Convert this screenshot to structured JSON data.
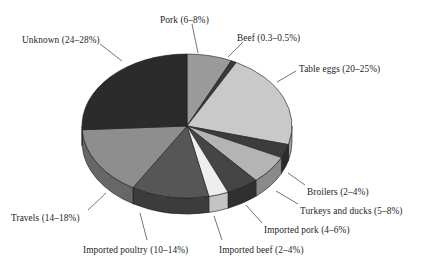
{
  "figure": {
    "kind": "pie-chart-3d",
    "background": "#ffffff"
  },
  "chart_data": {
    "type": "pie",
    "title": "",
    "subtitle": "",
    "xlabel": "",
    "ylabel": "",
    "legend_position": "none",
    "labels_outside": true,
    "grid": false,
    "three_d": true,
    "depth_px": 16,
    "center": [
      187,
      126
    ],
    "radius_x": 105,
    "radius_y": 72,
    "start_angle_deg": 0,
    "direction": "clockwise",
    "categories": [
      "Pork",
      "Beef",
      "Table eggs",
      "Broilers",
      "Turkeys and ducks",
      "Imported pork",
      "Imported beef",
      "Imported poultry",
      "Travels",
      "Unknown"
    ],
    "values": [
      7.0,
      0.4,
      22.0,
      3.0,
      6.5,
      5.0,
      3.0,
      12.0,
      16.0,
      26.0
    ],
    "range_labels": [
      "6–8%",
      "0.3–0.5%",
      "20–25%",
      "2–4%",
      "5–8%",
      "4–6%",
      "2–4%",
      "10–14%",
      "14–18%",
      "24–28%"
    ],
    "slices": [
      {
        "name": "Pork",
        "label": "Pork (6–8%)",
        "range": "6–8%",
        "value": 7.0,
        "a0": 0,
        "a1": 25,
        "top": "#9a9a9a",
        "side": "#6f6f6f"
      },
      {
        "name": "Beef",
        "label": "Beef (0.3–0.5%)",
        "range": "0.3–0.5%",
        "value": 0.4,
        "a0": 25,
        "a1": 28,
        "top": "#3a3a3a",
        "side": "#2a2a2a"
      },
      {
        "name": "Table eggs",
        "label": "Table eggs (20–25%)",
        "range": "20–25%",
        "value": 22.0,
        "a0": 28,
        "a1": 105,
        "top": "#c9c9c9",
        "side": "#9c9c9c"
      },
      {
        "name": "Broilers",
        "label": "Broilers (2–4%)",
        "range": "2–4%",
        "value": 3.0,
        "a0": 105,
        "a1": 116,
        "top": "#3c3c3c",
        "side": "#2b2b2b"
      },
      {
        "name": "Turkeys and ducks",
        "label": "Turkeys and ducks (5–8%)",
        "range": "5–8%",
        "value": 6.5,
        "a0": 116,
        "a1": 139,
        "top": "#b4b4b4",
        "side": "#8a8a8a"
      },
      {
        "name": "Imported pork",
        "label": "Imported pork (4–6%)",
        "range": "4–6%",
        "value": 5.0,
        "a0": 139,
        "a1": 157,
        "top": "#454545",
        "side": "#303030"
      },
      {
        "name": "Imported beef",
        "label": "Imported beef (2–4%)",
        "range": "2–4%",
        "value": 3.0,
        "a0": 157,
        "a1": 168,
        "top": "#eeeeee",
        "side": "#c4c4c4"
      },
      {
        "name": "Imported poultry",
        "label": "Imported poultry (10–14%)",
        "range": "10–14%",
        "value": 12.0,
        "a0": 168,
        "a1": 211,
        "top": "#565656",
        "side": "#3c3c3c"
      },
      {
        "name": "Travels",
        "label": "Travels (14–18%)",
        "range": "14–18%",
        "value": 16.0,
        "a0": 211,
        "a1": 267,
        "top": "#8e8e8e",
        "side": "#676767"
      },
      {
        "name": "Unknown",
        "label": "Unknown (24–28%)",
        "range": "24–28%",
        "value": 26.0,
        "a0": 267,
        "a1": 360,
        "top": "#2b2b2b",
        "side": "#1e1e1e"
      }
    ]
  },
  "labels": {
    "unknown": {
      "text": "Unknown (24–28%)",
      "x": 22,
      "y": 36
    },
    "pork": {
      "text": "Pork (6–8%)",
      "x": 160,
      "y": 16
    },
    "beef": {
      "text": "Beef (0.3–0.5%)",
      "x": 237,
      "y": 34
    },
    "table_eggs": {
      "text": "Table eggs (20–25%)",
      "x": 299,
      "y": 65
    },
    "broilers": {
      "text": "Broilers (2–4%)",
      "x": 307,
      "y": 188
    },
    "turkeys_and_ducks": {
      "text": "Turkeys and ducks (5–8%)",
      "x": 300,
      "y": 207
    },
    "imported_pork": {
      "text": "Imported pork (4–6%)",
      "x": 264,
      "y": 226
    },
    "imported_beef": {
      "text": "Imported beef (2–4%)",
      "x": 219,
      "y": 246
    },
    "imported_poultry": {
      "text": "Imported poultry (10–14%)",
      "x": 83,
      "y": 246
    },
    "travels": {
      "text": "Travels (14–18%)",
      "x": 11,
      "y": 214
    }
  }
}
